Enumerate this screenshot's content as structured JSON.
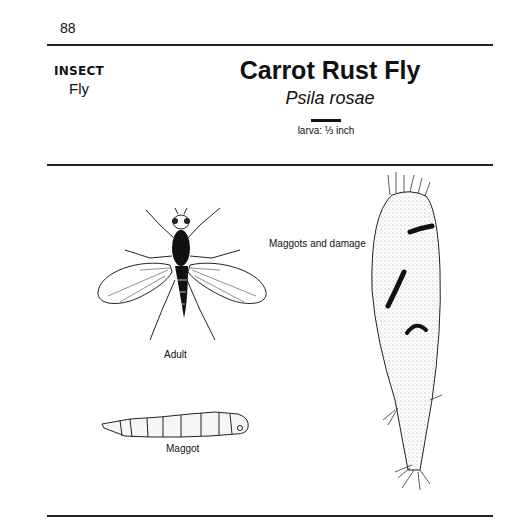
{
  "page": {
    "number": "88",
    "category": "INSECT",
    "subcategory": "Fly",
    "title": "Carrot Rust Fly",
    "scientific_name": "Psila rosae",
    "scale_label": "larva: ⅓ inch"
  },
  "illustrations": [
    {
      "name": "adult",
      "caption": "Adult"
    },
    {
      "name": "maggot",
      "caption": "Maggot"
    },
    {
      "name": "carrot-damage",
      "caption": "Maggots and damage"
    }
  ],
  "colors": {
    "ink": "#111111",
    "background": "#ffffff"
  }
}
